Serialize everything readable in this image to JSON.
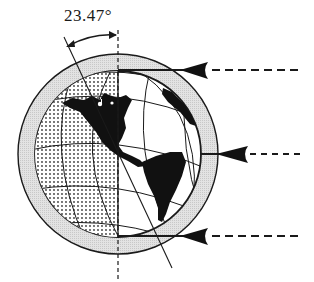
{
  "diagram": {
    "angle_label": "23.47°",
    "elements": {
      "tilted_axis": "Earth rotation axis tilted 23.47° from vertical",
      "vertical_axis": "vertical reference (dashed)",
      "atmosphere_ring": "shaded atmosphere ring",
      "night_side": "dotted left hemisphere",
      "continents": "North and South America (black)",
      "sun_rays": [
        {
          "position": "top",
          "label": ""
        },
        {
          "position": "middle",
          "label": ""
        },
        {
          "position": "bottom",
          "label": ""
        }
      ]
    },
    "colors": {
      "ink": "#1a1a1a",
      "ring_fill": "#d9d9d9",
      "dots": "#3a3a3a",
      "background": "#ffffff"
    }
  }
}
